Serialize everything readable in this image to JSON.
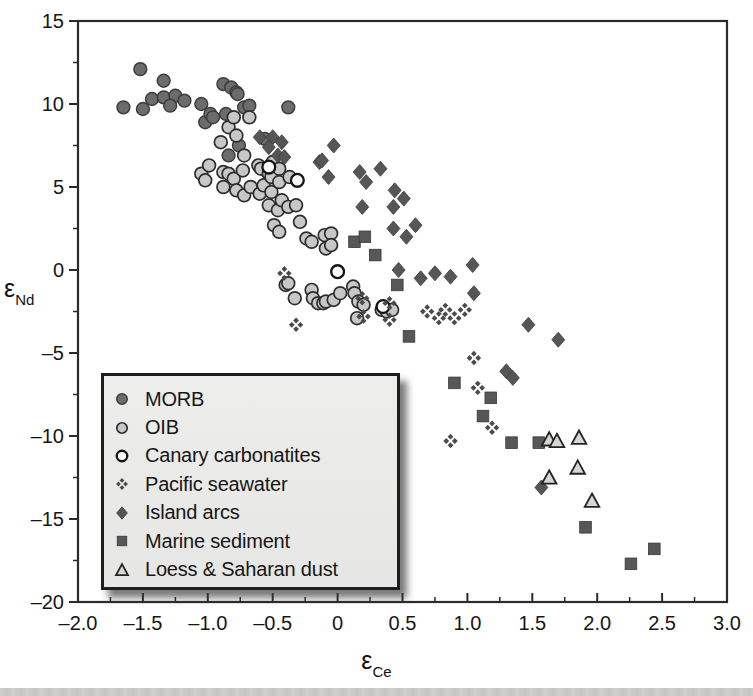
{
  "figure": {
    "type": "scientific-scatter-figure",
    "background": "#ffffff"
  },
  "chart_data": {
    "type": "scatter",
    "title": "",
    "xlabel_symbol": "ε",
    "xlabel_sub": "Ce",
    "ylabel_symbol": "ε",
    "ylabel_sub": "Nd",
    "x_axis": {
      "min": -2.0,
      "max": 3.0,
      "major_step": 0.5,
      "minor_step": 0.25,
      "tick_labels": [
        "–2.0",
        "–1.5",
        "–1.0",
        "–0.5",
        "0",
        "0.5",
        "1.0",
        "1.5",
        "2.0",
        "2.5",
        "3.0"
      ]
    },
    "y_axis": {
      "min": -20,
      "max": 15,
      "major_step": 5,
      "minor_step": 2.5,
      "tick_labels": [
        "15",
        "10",
        "5",
        "0",
        "–5",
        "–10",
        "–15",
        "–20"
      ]
    },
    "grid": "off",
    "legend_position": "lower-left-inside",
    "axis_color": "#2b2b2b",
    "series": [
      {
        "name": "MORB",
        "marker": "circle",
        "fill": "#6c6c6c",
        "stroke": "#3d3d3d",
        "stroke_width": 1.5,
        "points": [
          [
            -1.52,
            12.1
          ],
          [
            -1.34,
            11.4
          ],
          [
            -1.43,
            10.3
          ],
          [
            -1.65,
            9.8
          ],
          [
            -1.5,
            9.7
          ],
          [
            -1.34,
            10.4
          ],
          [
            -1.25,
            10.5
          ],
          [
            -1.18,
            10.2
          ],
          [
            -1.29,
            9.9
          ],
          [
            -1.05,
            10.0
          ],
          [
            -1.02,
            8.9
          ],
          [
            -0.98,
            9.4
          ],
          [
            -0.96,
            9.2
          ],
          [
            -0.88,
            11.2
          ],
          [
            -0.86,
            9.4
          ],
          [
            -0.84,
            6.9
          ],
          [
            -0.82,
            11.0
          ],
          [
            -0.78,
            10.7
          ],
          [
            -0.77,
            10.6
          ],
          [
            -0.76,
            7.5
          ],
          [
            -0.72,
            9.8
          ],
          [
            -0.68,
            9.9
          ],
          [
            -0.56,
            7.9
          ],
          [
            -0.38,
            9.8
          ]
        ]
      },
      {
        "name": "OIB",
        "marker": "circle",
        "fill": "#c7c7c7",
        "stroke": "#2d2d2d",
        "stroke_width": 1.7,
        "points": [
          [
            -1.05,
            5.8
          ],
          [
            -1.02,
            5.4
          ],
          [
            -0.99,
            6.3
          ],
          [
            -0.9,
            7.7
          ],
          [
            -0.88,
            5.9
          ],
          [
            -0.88,
            5.0
          ],
          [
            -0.84,
            8.6
          ],
          [
            -0.84,
            5.8
          ],
          [
            -0.8,
            9.2
          ],
          [
            -0.8,
            5.5
          ],
          [
            -0.78,
            8.1
          ],
          [
            -0.78,
            4.8
          ],
          [
            -0.73,
            6.0
          ],
          [
            -0.72,
            6.9
          ],
          [
            -0.72,
            4.5
          ],
          [
            -0.68,
            9.2
          ],
          [
            -0.67,
            5.0
          ],
          [
            -0.61,
            6.3
          ],
          [
            -0.6,
            4.6
          ],
          [
            -0.59,
            6.1
          ],
          [
            -0.57,
            5.1
          ],
          [
            -0.53,
            5.8
          ],
          [
            -0.53,
            3.9
          ],
          [
            -0.51,
            5.6
          ],
          [
            -0.51,
            4.7
          ],
          [
            -0.5,
            6.5
          ],
          [
            -0.49,
            2.7
          ],
          [
            -0.46,
            3.6
          ],
          [
            -0.45,
            6.1
          ],
          [
            -0.45,
            5.3
          ],
          [
            -0.45,
            2.3
          ],
          [
            -0.43,
            4.2
          ],
          [
            -0.38,
            3.8
          ],
          [
            -0.37,
            5.6
          ],
          [
            -0.32,
            3.9
          ],
          [
            -0.29,
            2.9
          ],
          [
            -0.24,
            1.9
          ],
          [
            -0.2,
            1.7
          ],
          [
            -0.1,
            2.1
          ],
          [
            -0.09,
            1.3
          ],
          [
            -0.05,
            2.2
          ],
          [
            -0.05,
            1.5
          ],
          [
            -0.4,
            -0.9
          ],
          [
            -0.38,
            -0.8
          ],
          [
            -0.33,
            -1.7
          ],
          [
            -0.2,
            -1.2
          ],
          [
            -0.19,
            -1.7
          ],
          [
            -0.15,
            -2.0
          ],
          [
            -0.11,
            -2.0
          ],
          [
            -0.09,
            -1.9
          ],
          [
            -0.03,
            -1.8
          ],
          [
            0.02,
            -1.4
          ],
          [
            0.12,
            -1.0
          ],
          [
            0.13,
            -1.4
          ],
          [
            0.16,
            -1.9
          ],
          [
            0.2,
            -2.1
          ],
          [
            0.15,
            -2.9
          ],
          [
            0.34,
            -2.4
          ],
          [
            0.38,
            -2.5
          ],
          [
            0.42,
            -2.4
          ]
        ]
      },
      {
        "name": "Canary carbonatites",
        "marker": "circle",
        "fill": "#fbfbf9",
        "stroke": "#141414",
        "stroke_width": 2.3,
        "points": [
          [
            -0.53,
            6.2
          ],
          [
            -0.31,
            5.4
          ],
          [
            0.0,
            -0.1
          ],
          [
            0.35,
            -2.2
          ]
        ]
      },
      {
        "name": "Pacific seawater",
        "marker": "cross-diamonds",
        "fill": "#4b4b4b",
        "stroke": "none",
        "stroke_width": 0,
        "points": [
          [
            -0.41,
            -0.2
          ],
          [
            -0.32,
            -3.3
          ],
          [
            0.19,
            -1.7
          ],
          [
            0.2,
            -2.8
          ],
          [
            0.4,
            -2.0
          ],
          [
            0.4,
            -3.0
          ],
          [
            0.69,
            -2.5
          ],
          [
            0.78,
            -2.9
          ],
          [
            0.83,
            -2.4
          ],
          [
            0.9,
            -2.9
          ],
          [
            0.98,
            -2.4
          ],
          [
            1.05,
            -5.3
          ],
          [
            1.08,
            -7.1
          ],
          [
            1.19,
            -9.5
          ],
          [
            0.87,
            -10.3
          ]
        ]
      },
      {
        "name": "Island arcs",
        "marker": "diamond",
        "fill": "#565656",
        "stroke": "#3a3a3a",
        "stroke_width": 0.8,
        "points": [
          [
            -0.6,
            8.0
          ],
          [
            -0.5,
            8.0
          ],
          [
            -0.53,
            7.4
          ],
          [
            -0.43,
            7.7
          ],
          [
            -0.46,
            6.9
          ],
          [
            -0.41,
            6.8
          ],
          [
            -0.14,
            6.5
          ],
          [
            -0.03,
            7.5
          ],
          [
            -0.12,
            6.6
          ],
          [
            -0.07,
            5.6
          ],
          [
            0.17,
            5.9
          ],
          [
            0.22,
            5.3
          ],
          [
            0.33,
            6.1
          ],
          [
            0.44,
            4.8
          ],
          [
            0.51,
            4.3
          ],
          [
            0.43,
            3.8
          ],
          [
            0.19,
            3.8
          ],
          [
            0.43,
            2.5
          ],
          [
            0.6,
            2.7
          ],
          [
            0.53,
            2.0
          ],
          [
            0.47,
            0.0
          ],
          [
            0.64,
            -0.5
          ],
          [
            0.75,
            -0.2
          ],
          [
            0.87,
            -0.4
          ],
          [
            1.04,
            0.3
          ],
          [
            1.05,
            -1.4
          ],
          [
            1.47,
            -3.3
          ],
          [
            1.7,
            -4.2
          ],
          [
            1.3,
            -6.1
          ],
          [
            1.35,
            -6.5
          ],
          [
            1.57,
            -13.1
          ]
        ]
      },
      {
        "name": "Marine sediment",
        "marker": "square",
        "fill": "#575757",
        "stroke": "#3a3a3a",
        "stroke_width": 0.8,
        "points": [
          [
            0.13,
            1.7
          ],
          [
            0.21,
            2.0
          ],
          [
            0.29,
            0.9
          ],
          [
            0.46,
            -0.9
          ],
          [
            0.55,
            -4.0
          ],
          [
            0.9,
            -6.8
          ],
          [
            1.18,
            -7.7
          ],
          [
            1.12,
            -8.8
          ],
          [
            1.34,
            -10.4
          ],
          [
            1.55,
            -10.4
          ],
          [
            1.91,
            -15.5
          ],
          [
            2.26,
            -17.7
          ],
          [
            2.44,
            -16.8
          ]
        ]
      },
      {
        "name": "Loess & Saharan dust",
        "marker": "triangle",
        "fill": "#d6d6d3",
        "stroke": "#242424",
        "stroke_width": 1.8,
        "points": [
          [
            1.63,
            -10.2
          ],
          [
            1.69,
            -10.3
          ],
          [
            1.86,
            -10.1
          ],
          [
            1.85,
            -11.9
          ],
          [
            1.63,
            -12.5
          ],
          [
            1.96,
            -13.9
          ]
        ]
      }
    ]
  },
  "legend": {
    "items": [
      "MORB",
      "OIB",
      "Canary carbonatites",
      "Pacific seawater",
      "Island arcs",
      "Marine sediment",
      "Loess & Saharan dust"
    ]
  }
}
